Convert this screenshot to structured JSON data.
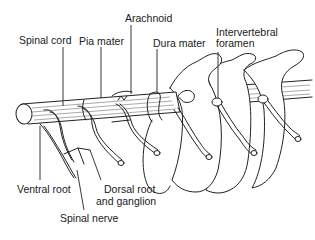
{
  "figure": {
    "ink_color": "#222222",
    "background": "#ffffff"
  },
  "labels": {
    "spinal_cord": "Spinal cord",
    "pia_mater": "Pia mater",
    "arachnoid": "Arachnoid",
    "dura_mater": "Dura mater",
    "intervertebral_foramen_line1": "Intervertebral",
    "intervertebral_foramen_line2": "foramen",
    "ventral_root": "Ventral root",
    "dorsal_root_line1": "Dorsal root",
    "dorsal_root_line2": "and ganglion",
    "spinal_nerve": "Spinal nerve"
  }
}
